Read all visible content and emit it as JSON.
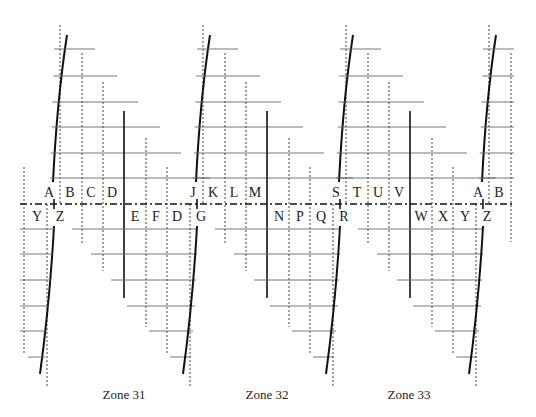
{
  "diagram": {
    "type": "utm-mgrs-zone-grid",
    "zones": [
      {
        "label": "Zone 31",
        "base_x": 60
      },
      {
        "label": "Zone 32",
        "base_x": 203
      },
      {
        "label": "Zone 33",
        "base_x": 346
      }
    ],
    "extra_zone_base_x": 489,
    "north_letters": [
      [
        "A",
        "B",
        "C",
        "D"
      ],
      [
        "J",
        "K",
        "L",
        "M"
      ],
      [
        "S",
        "T",
        "U",
        "V"
      ],
      [
        "A",
        "B"
      ]
    ],
    "south_letters": [
      [
        "Y",
        "Z",
        "E",
        "F",
        "D",
        "G"
      ],
      [
        "N",
        "P",
        "Q",
        "R"
      ],
      [
        "W",
        "X",
        "Y",
        "Z"
      ]
    ],
    "equator_label": "",
    "colors": {
      "line": "#111111",
      "grid": "#666666",
      "background": "#ffffff"
    }
  },
  "labels": {
    "north": [
      {
        "t": "A",
        "x": 49,
        "y": 197
      },
      {
        "t": "B",
        "x": 70,
        "y": 197
      },
      {
        "t": "C",
        "x": 91,
        "y": 197
      },
      {
        "t": "D",
        "x": 112,
        "y": 197
      },
      {
        "t": "J",
        "x": 193,
        "y": 197
      },
      {
        "t": "K",
        "x": 213,
        "y": 197
      },
      {
        "t": "L",
        "x": 234,
        "y": 197
      },
      {
        "t": "M",
        "x": 255,
        "y": 197
      },
      {
        "t": "S",
        "x": 336,
        "y": 197
      },
      {
        "t": "T",
        "x": 357,
        "y": 197
      },
      {
        "t": "U",
        "x": 378,
        "y": 197
      },
      {
        "t": "V",
        "x": 399,
        "y": 197
      },
      {
        "t": "A",
        "x": 478,
        "y": 197
      },
      {
        "t": "B",
        "x": 499,
        "y": 197
      }
    ],
    "south": [
      {
        "t": "Y",
        "x": 37,
        "y": 221
      },
      {
        "t": "Z",
        "x": 60,
        "y": 221
      },
      {
        "t": "E",
        "x": 135,
        "y": 221
      },
      {
        "t": "F",
        "x": 156,
        "y": 221
      },
      {
        "t": "D",
        "x": 177,
        "y": 221
      },
      {
        "t": "G",
        "x": 201,
        "y": 221
      },
      {
        "t": "N",
        "x": 279,
        "y": 221
      },
      {
        "t": "P",
        "x": 300,
        "y": 221
      },
      {
        "t": "Q",
        "x": 321,
        "y": 221
      },
      {
        "t": "R",
        "x": 344,
        "y": 221
      },
      {
        "t": "W",
        "x": 421,
        "y": 221
      },
      {
        "t": "X",
        "x": 443,
        "y": 221
      },
      {
        "t": "Y",
        "x": 465,
        "y": 221
      },
      {
        "t": "Z",
        "x": 487,
        "y": 221
      }
    ],
    "zones": [
      {
        "t": "Zone 31",
        "x": 124,
        "y": 399
      },
      {
        "t": "Zone 32",
        "x": 267,
        "y": 399
      },
      {
        "t": "Zone 33",
        "x": 409,
        "y": 399
      }
    ]
  }
}
